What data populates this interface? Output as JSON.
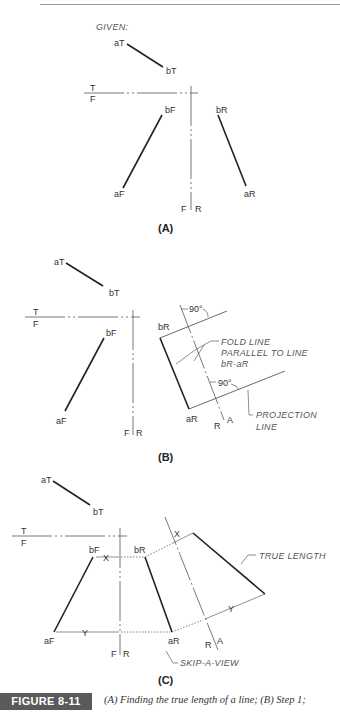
{
  "header": {
    "running_text": "CH. 8 p."
  },
  "figure_a": {
    "given_label": "GIVEN:",
    "panel_label": "(A)",
    "labels": {
      "aT": "aT",
      "bT": "bT",
      "T": "T",
      "F": "F",
      "bF": "bF",
      "aF": "aF",
      "bR": "bR",
      "aR": "aR",
      "F2": "F",
      "R": "R"
    }
  },
  "figure_b": {
    "panel_label": "(B)",
    "labels": {
      "aT": "aT",
      "bT": "bT",
      "T": "T",
      "F": "F",
      "bF": "bF",
      "aF": "aF",
      "bR": "bR",
      "aR": "aR",
      "F2": "F",
      "R": "R",
      "R2": "R",
      "A": "A"
    },
    "angle_top": "90°",
    "angle_bottom": "90°",
    "fold_note": [
      "FOLD LINE",
      "PARALLEL TO LINE",
      "bR-aR"
    ],
    "projection_note": [
      "PROJECTION",
      "LINE"
    ]
  },
  "figure_c": {
    "panel_label": "(C)",
    "labels": {
      "aT": "aT",
      "bT": "bT",
      "T": "T",
      "F": "F",
      "bF": "bF",
      "aF": "aF",
      "bR": "bR",
      "aR": "aR",
      "F2": "F",
      "R": "R",
      "R2": "R",
      "A": "A"
    },
    "dim_x": "X",
    "dim_y": "Y",
    "dim_x2": "X",
    "dim_y2": "Y",
    "true_length_note": "TRUE LENGTH",
    "skip_note": "SKIP-A-VIEW"
  },
  "caption": {
    "tag": "FIGURE 8-11",
    "text": "(A) Finding the true length of a line; (B) Step 1;"
  }
}
